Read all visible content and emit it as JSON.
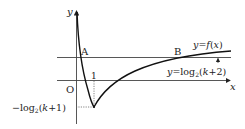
{
  "diagram": {
    "axes": {
      "x_label": "x",
      "y_label": "y",
      "origin_label": "O"
    },
    "tick_x": "1",
    "point_labels": {
      "A": "A",
      "B": "B"
    },
    "curve_label": {
      "prefix": "y",
      "eq": "=",
      "fn": "f",
      "open": "(",
      "var": "x",
      "close": ")"
    },
    "line_label": {
      "prefix": "y",
      "eq": "=log",
      "base": "2",
      "open": "(",
      "k": "k",
      "rest": "+2)"
    },
    "min_label": {
      "minus": "−log",
      "base": "2",
      "open": "(",
      "k": "k",
      "rest": "+1)"
    },
    "colors": {
      "stroke": "#222222",
      "grid": "#555555"
    }
  }
}
